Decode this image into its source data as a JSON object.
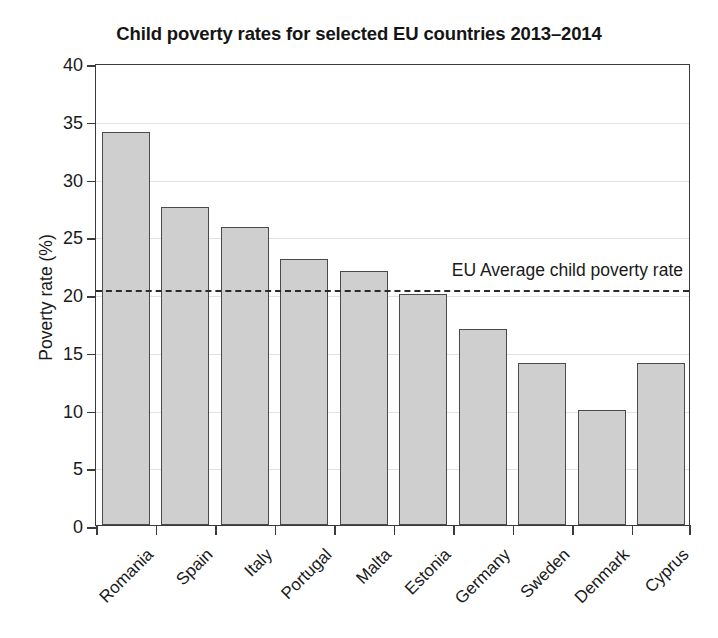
{
  "chart_data": {
    "type": "bar",
    "title": "Child poverty rates for selected EU countries 2013–2014",
    "xlabel": "",
    "ylabel": "Poverty rate (%)",
    "ylim": [
      0,
      40
    ],
    "yticks": [
      0,
      5,
      10,
      15,
      20,
      25,
      30,
      35,
      40
    ],
    "ytick_labels": [
      "0",
      "5",
      "10",
      "15",
      "20",
      "25",
      "30",
      "35",
      "40"
    ],
    "grid": true,
    "legend_position": "none",
    "categories": [
      "Romania",
      "Spain",
      "Italy",
      "Portugal",
      "Malta",
      "Estonia",
      "Germany",
      "Sweden",
      "Denmark",
      "Cyprus"
    ],
    "values": [
      34.0,
      27.5,
      25.8,
      23.0,
      22.0,
      20.0,
      17.0,
      14.0,
      10.0,
      14.0
    ],
    "bar_color": "#cfcfcf",
    "bar_edge_color": "#4a4a4a",
    "annotations": [
      {
        "name": "eu-average-line",
        "label": "EU Average child poverty rate",
        "value": 20.5,
        "style": "dashed",
        "color": "#2b2b2b"
      }
    ]
  }
}
